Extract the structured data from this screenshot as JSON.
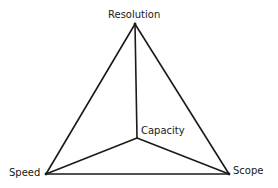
{
  "diagram": {
    "type": "tetrahedron-trade-off",
    "vertices": {
      "top": {
        "label": "Resolution",
        "x": 135,
        "y": 24
      },
      "left": {
        "label": "Speed",
        "x": 46,
        "y": 174
      },
      "right": {
        "label": "Scope",
        "x": 229,
        "y": 174
      },
      "center": {
        "label": "Capacity",
        "x": 137,
        "y": 138
      }
    },
    "edges": [
      [
        "top",
        "left"
      ],
      [
        "top",
        "right"
      ],
      [
        "left",
        "right"
      ],
      [
        "top",
        "center"
      ],
      [
        "left",
        "center"
      ],
      [
        "right",
        "center"
      ]
    ],
    "stroke_color": "#1a1a1a"
  }
}
